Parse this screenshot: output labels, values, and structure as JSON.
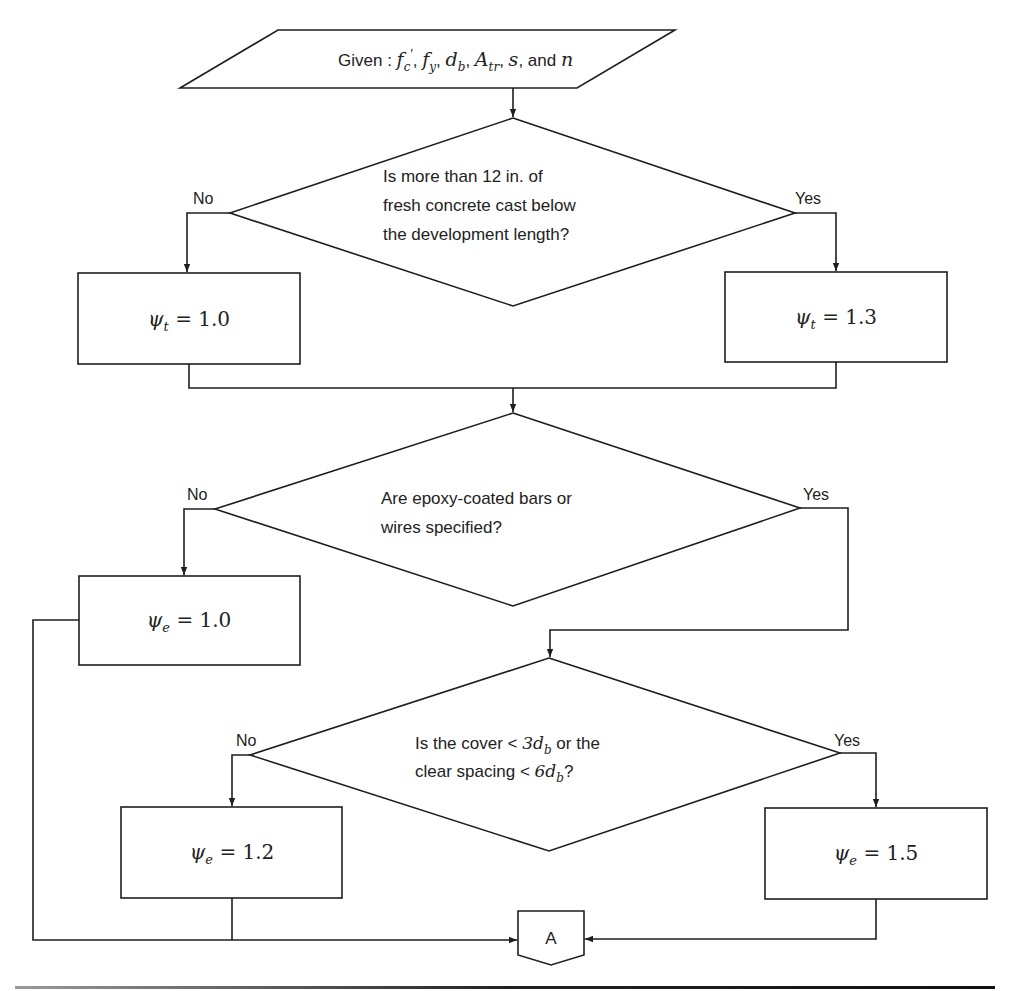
{
  "diagram": {
    "type": "flowchart",
    "input": {
      "prefix": "Given : ",
      "vars": "f′c, fy, db, Atr, s, and n",
      "parts": [
        {
          "t": "f",
          "sub": "c",
          "sup": "′"
        },
        {
          "t": "f",
          "sub": "y"
        },
        {
          "t": "d",
          "sub": "b"
        },
        {
          "t": "A",
          "sub": "tr"
        },
        {
          "t": "s"
        },
        {
          "t": "n"
        }
      ],
      "and_label": "and"
    },
    "decisions": [
      {
        "id": "cast-below",
        "lines": [
          "Is more than 12 in. of",
          "fresh concrete cast below",
          "the development length?"
        ],
        "no_label": "No",
        "yes_label": "Yes"
      },
      {
        "id": "epoxy",
        "lines": [
          "Are epoxy-coated bars or",
          "wires specified?"
        ],
        "no_label": "No",
        "yes_label": "Yes"
      },
      {
        "id": "cover-spacing",
        "line1_prefix": "Is the cover < ",
        "line1_math": "3d",
        "line1_sub": "b",
        "line1_suffix": " or the",
        "line2_prefix": "clear spacing < ",
        "line2_math": "6d",
        "line2_sub": "b",
        "line2_suffix": "?",
        "no_label": "No",
        "yes_label": "Yes"
      }
    ],
    "results": [
      {
        "symbol": "ψ",
        "sub": "t",
        "value": "= 1.0"
      },
      {
        "symbol": "ψ",
        "sub": "t",
        "value": "= 1.3"
      },
      {
        "symbol": "ψ",
        "sub": "e",
        "value": "= 1.0"
      },
      {
        "symbol": "ψ",
        "sub": "e",
        "value": "= 1.2"
      },
      {
        "symbol": "ψ",
        "sub": "e",
        "value": "= 1.5"
      }
    ],
    "connector": {
      "label": "A"
    }
  }
}
